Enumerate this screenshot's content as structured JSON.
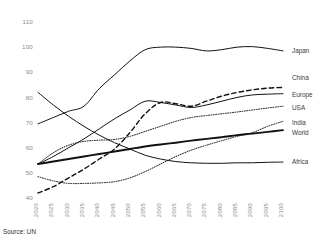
{
  "source_note": "Source: UN",
  "chart_data": {
    "type": "line",
    "title": "",
    "subtitle": "",
    "xlabel": "",
    "ylabel": "",
    "xlim": [
      2020,
      2100
    ],
    "ylim": [
      40,
      110
    ],
    "ytick_step": 10,
    "grid": false,
    "legend_position": "right",
    "x": [
      2020,
      2025,
      2030,
      2035,
      2040,
      2045,
      2050,
      2055,
      2060,
      2065,
      2070,
      2075,
      2080,
      2085,
      2090,
      2095,
      2100
    ],
    "xtick_labels": [
      "2020",
      "2025",
      "2030",
      "2035",
      "2040",
      "2045",
      "2050",
      "2055",
      "2060",
      "2065",
      "2070",
      "2075",
      "2080",
      "2085",
      "2090",
      "2095",
      "2100"
    ],
    "ytick_labels": [
      "40",
      "50",
      "60",
      "70",
      "80",
      "90",
      "100",
      "110"
    ],
    "ytick_values": [
      40,
      50,
      60,
      70,
      80,
      90,
      100,
      110
    ],
    "series": [
      {
        "name": "Japan",
        "style": "solid",
        "width": 1.0,
        "values": [
          69.5,
          72.0,
          74.5,
          76.5,
          83.5,
          89.0,
          94.5,
          99.0,
          100.0,
          100.0,
          99.5,
          98.5,
          99.0,
          100.0,
          100.2,
          99.5,
          98.5
        ]
      },
      {
        "name": "China",
        "style": "dashed",
        "width": 1.4,
        "values": [
          42.0,
          44.5,
          48.0,
          51.5,
          55.5,
          59.5,
          66.0,
          73.5,
          78.0,
          77.5,
          76.5,
          78.5,
          80.5,
          82.0,
          83.0,
          83.7,
          84.0
        ]
      },
      {
        "name": "Europe",
        "style": "solid",
        "width": 1.0,
        "values": [
          53.5,
          56.5,
          60.0,
          63.5,
          67.5,
          71.5,
          75.0,
          78.5,
          78.0,
          77.0,
          76.0,
          77.0,
          78.5,
          80.0,
          81.0,
          81.3,
          81.5
        ]
      },
      {
        "name": "USA",
        "style": "dotted",
        "width": 1.0,
        "values": [
          53.5,
          58.0,
          61.0,
          62.5,
          63.0,
          63.3,
          64.5,
          66.5,
          68.5,
          70.5,
          72.0,
          72.8,
          73.5,
          74.2,
          75.0,
          75.8,
          76.5
        ]
      },
      {
        "name": "India",
        "style": "dotted",
        "width": 1.0,
        "values": [
          48.5,
          46.8,
          45.8,
          45.8,
          46.0,
          46.5,
          48.0,
          50.5,
          53.5,
          56.5,
          59.0,
          61.0,
          62.8,
          64.5,
          66.0,
          68.5,
          70.5
        ]
      },
      {
        "name": "World",
        "style": "solid",
        "width": 1.9,
        "values": [
          53.5,
          54.5,
          55.5,
          56.5,
          57.5,
          58.5,
          59.5,
          60.5,
          61.3,
          62.0,
          62.8,
          63.5,
          64.2,
          65.0,
          65.6,
          66.3,
          67.0
        ]
      },
      {
        "name": "Africa",
        "style": "solid",
        "width": 1.0,
        "values": [
          82.0,
          77.0,
          72.5,
          68.5,
          65.0,
          62.0,
          59.5,
          57.0,
          55.5,
          54.5,
          54.0,
          53.8,
          53.8,
          54.0,
          54.0,
          54.2,
          54.3
        ]
      }
    ],
    "legend_entries": [
      {
        "label": "Japan",
        "y_value": 98.5
      },
      {
        "label": "China",
        "y_value": 88.0
      },
      {
        "label": "Europe",
        "y_value": 81.0
      },
      {
        "label": "USA",
        "y_value": 76.0
      },
      {
        "label": "India",
        "y_value": 70.0
      },
      {
        "label": "World",
        "y_value": 66.0
      },
      {
        "label": "Africa",
        "y_value": 54.3
      }
    ]
  },
  "colors": {
    "line": "#111111",
    "tick_text": "#8a8a8a",
    "legend_text": "#3a3a3a",
    "background": "#ffffff"
  }
}
